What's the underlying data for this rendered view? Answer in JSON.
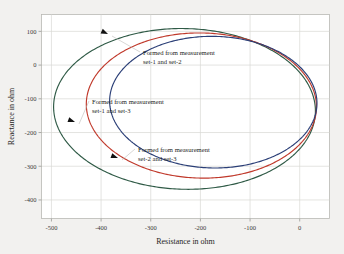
{
  "chart_data": {
    "type": "line",
    "title": "",
    "xlabel": "Resistance in ohm",
    "ylabel": "Reactance in ohm",
    "xlim": [
      -520,
      60
    ],
    "ylim": [
      -455,
      150
    ],
    "xticks": [
      -500,
      -400,
      -300,
      -200,
      -100,
      0
    ],
    "xticklabels": [
      "-500",
      "-400",
      "-300",
      "-200",
      "-100",
      "0"
    ],
    "yticks": [
      100,
      0,
      -100,
      -200,
      -300,
      -400
    ],
    "yticklabels": [
      "100",
      "0",
      "-100",
      "-200",
      "-300",
      "-400"
    ],
    "grid": true,
    "legend": "none",
    "series": [
      {
        "name": "Formed from measurement set-1 and set-2",
        "color": "#2f5a46",
        "shape": "ellipse",
        "center_x": -232,
        "center_y": -130,
        "semi_axis_x": 264,
        "semi_axis_y": 238,
        "rotation_deg": -7
      },
      {
        "name": "Formed from measurement set-1 and set-3",
        "color": "#c0392b",
        "shape": "ellipse",
        "center_x": -198,
        "center_y": -120,
        "semi_axis_x": 232,
        "semi_axis_y": 215,
        "rotation_deg": -7
      },
      {
        "name": "Formed from measurement set-2 and set-3",
        "color": "#2b3f77",
        "shape": "ellipse",
        "center_x": -174,
        "center_y": -110,
        "semi_axis_x": 209,
        "semi_axis_y": 195,
        "rotation_deg": -7
      }
    ],
    "annotations": [
      {
        "id": "annot-set1-set2",
        "line1": "Formed from measurement",
        "line2": "set-1 and set-2",
        "text_x": 143,
        "text_y": 55,
        "arrow_x": 108,
        "arrow_y": 34,
        "arrow_angle_deg": 205
      },
      {
        "id": "annot-set1-set3",
        "line1": "Formed from measurement",
        "line2": "set-1 and set-3",
        "text_x": 92,
        "text_y": 104,
        "arrow_x": 75,
        "arrow_y": 122,
        "arrow_angle_deg": 200
      },
      {
        "id": "annot-set2-set3",
        "line1": "Formed from measurement",
        "line2": "set-2 and set-3",
        "text_x": 138,
        "text_y": 152,
        "arrow_x": 118,
        "arrow_y": 158,
        "arrow_angle_deg": 200
      }
    ],
    "colors": {
      "background": "#f2f1ef",
      "plot_area": "#ffffff",
      "grid": "#d9d8d4",
      "frame": "#b9b8b4",
      "text": "#262624"
    }
  }
}
